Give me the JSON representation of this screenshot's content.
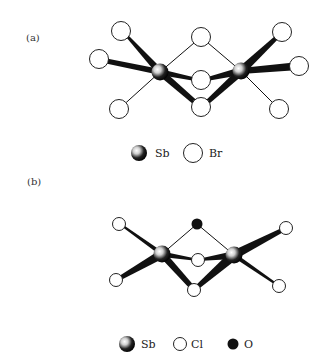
{
  "panels": [
    {
      "label": "(a)",
      "legend": [
        {
          "symbol": "sb-sphere",
          "text": "Sb"
        },
        {
          "symbol": "open-circle",
          "text": "Br"
        }
      ],
      "atoms": {
        "Sb": [
          "Sb1",
          "Sb2"
        ],
        "Br": [
          "Br-top-left",
          "Br-left",
          "Br-bottom-left",
          "Br-top-center",
          "Br-mid-center",
          "Br-bottom-center",
          "Br-top-right",
          "Br-right",
          "Br-bottom-right"
        ]
      }
    },
    {
      "label": "(b)",
      "legend": [
        {
          "symbol": "sb-sphere",
          "text": "Sb"
        },
        {
          "symbol": "open-circle",
          "text": "Cl"
        },
        {
          "symbol": "filled-circle",
          "text": "O"
        }
      ],
      "atoms": {
        "Sb": [
          "Sb1",
          "Sb2"
        ],
        "Cl": [
          "Cl-top-left",
          "Cl-bottom-left",
          "Cl-mid-center",
          "Cl-bottom-center",
          "Cl-top-right",
          "Cl-bottom-right"
        ],
        "O": [
          "O-top-center"
        ]
      }
    }
  ],
  "colors": {
    "bond": "#111111",
    "atom_outline": "#222222",
    "oxygen_fill": "#111111"
  }
}
